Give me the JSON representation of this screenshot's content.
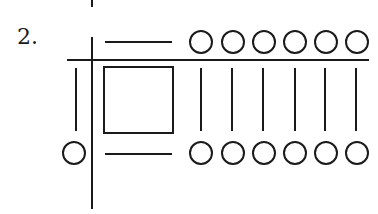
{
  "figure": {
    "label": "2.",
    "stroke_color": "#1a1a1a",
    "background": "#ffffff"
  },
  "elements": {
    "top_tick": {
      "x": 92,
      "y1": 0,
      "y2": 7
    },
    "vertical_axis": {
      "x": 92,
      "y1": 37,
      "y2": 209
    },
    "horizontal_axis": {
      "y": 60,
      "x1": 67,
      "x2": 369
    },
    "top_dash": {
      "y": 42,
      "x1": 105,
      "x2": 172
    },
    "bottom_dash": {
      "y": 154,
      "x1": 105,
      "x2": 172
    },
    "square": {
      "x": 104,
      "y": 67,
      "w": 69,
      "h": 66
    },
    "left_bar": {
      "x": 76,
      "y1": 68,
      "y2": 131
    },
    "left_circle": {
      "cx": 74,
      "cy": 153,
      "r": 11
    },
    "top_circles": {
      "cy": 42,
      "r": 11,
      "cx": [
        201,
        233,
        264,
        295,
        326,
        357
      ]
    },
    "bottom_circles": {
      "cy": 153,
      "r": 11,
      "cx": [
        201,
        233,
        264,
        295,
        326,
        357
      ]
    },
    "vertical_ticks": {
      "y1": 68,
      "y2": 131,
      "x": [
        201,
        232,
        263,
        295,
        325,
        356
      ]
    }
  }
}
